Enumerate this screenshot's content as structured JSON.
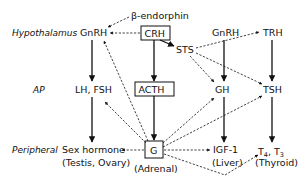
{
  "rows": {
    "hypothalamus": "Hypothalamus",
    "ap": "AP",
    "peripheral": "Peripheral"
  },
  "nodes": {
    "beta_endorphin": "β-endorphin",
    "gnrh_left": "GnRH",
    "crh": "CRH",
    "sts": "STS",
    "gnrh_right": "GnRH",
    "trh": "TRH",
    "lh_fsh": "LH, FSH",
    "acth": "ACTH",
    "gh": "GH",
    "tsh": "TSH",
    "sex_hormone": "Sex hormone",
    "sex_hormone_sub": "(Testis, Ovary)",
    "g": "G",
    "g_sub": "(Adrenal)",
    "igf1": "IGF-1",
    "igf1_sub": "(Liver)",
    "t4": "T",
    "t4_sub": "4",
    "t3_sep": ", T",
    "t3_sub": "3",
    "t_sub": "(Thyroid)"
  },
  "edges": [
    {
      "from": "gnrh_left",
      "to": "lh_fsh",
      "style": "solid"
    },
    {
      "from": "lh_fsh",
      "to": "sex_hormone",
      "style": "solid"
    },
    {
      "from": "crh",
      "to": "acth",
      "style": "solid"
    },
    {
      "from": "acth",
      "to": "g",
      "style": "solid"
    },
    {
      "from": "crh",
      "to": "sts",
      "style": "solid"
    },
    {
      "from": "gnrh_right",
      "to": "gh",
      "style": "solid"
    },
    {
      "from": "gh",
      "to": "igf1",
      "style": "solid"
    },
    {
      "from": "trh",
      "to": "tsh",
      "style": "solid"
    },
    {
      "from": "tsh",
      "to": "t4_t3",
      "style": "solid"
    },
    {
      "from": "beta_endorphin",
      "to": "gnrh_left",
      "style": "dashed"
    },
    {
      "from": "crh",
      "to": "gnrh_left",
      "style": "dashed"
    },
    {
      "from": "sts",
      "to": "trh",
      "style": "dashed"
    },
    {
      "from": "sts",
      "to": "gh",
      "style": "dashed"
    },
    {
      "from": "sts",
      "to": "tsh",
      "style": "dashed"
    },
    {
      "from": "g",
      "to": "gnrh_left",
      "style": "dashed"
    },
    {
      "from": "g",
      "to": "lh_fsh",
      "style": "dashed"
    },
    {
      "from": "g",
      "to": "sex_hormone",
      "style": "dashed"
    },
    {
      "from": "g",
      "to": "gh",
      "style": "dashed"
    },
    {
      "from": "g",
      "to": "tsh",
      "style": "dashed"
    },
    {
      "from": "g",
      "to": "igf1",
      "style": "dashed"
    },
    {
      "from": "g",
      "to": "t4_t3",
      "style": "dashed"
    }
  ],
  "colors": {
    "ink": "#111111",
    "background": "#ffffff"
  }
}
